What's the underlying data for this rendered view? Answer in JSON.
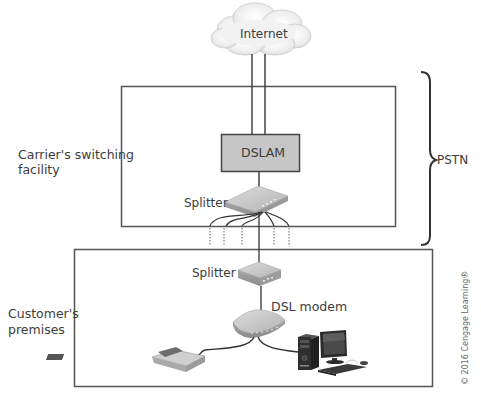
{
  "diagram": {
    "nodes": {
      "internet": {
        "label": "Internet",
        "shape": "cloud"
      },
      "dslam": {
        "label": "DSLAM",
        "shape": "box",
        "fill": "#c8c8c8"
      },
      "carrier_splitter": {
        "label": "Splitter",
        "shape": "device"
      },
      "customer_splitter": {
        "label": "Splitter",
        "shape": "device"
      },
      "dsl_modem": {
        "label": "DSL modem",
        "shape": "device"
      },
      "telephone": {
        "label": "",
        "shape": "telephone"
      },
      "computer": {
        "label": "",
        "shape": "desktop-computer"
      }
    },
    "regions": {
      "carrier": {
        "label_line1": "Carrier's switching",
        "label_line2": "facility"
      },
      "customer": {
        "label_line1": "Customer's",
        "label_line2": "premises"
      },
      "pstn": {
        "label": "PSTN"
      }
    },
    "edges": [
      {
        "from": "internet",
        "to": "dslam",
        "count": 2
      },
      {
        "from": "dslam",
        "to": "carrier_splitter"
      },
      {
        "from": "carrier_splitter",
        "to": "customer_splitter"
      },
      {
        "from": "customer_splitter",
        "to": "dsl_modem"
      },
      {
        "from": "dsl_modem",
        "to": "telephone"
      },
      {
        "from": "dsl_modem",
        "to": "computer"
      }
    ],
    "copyright": "© 2016 Cengage Learning®"
  }
}
